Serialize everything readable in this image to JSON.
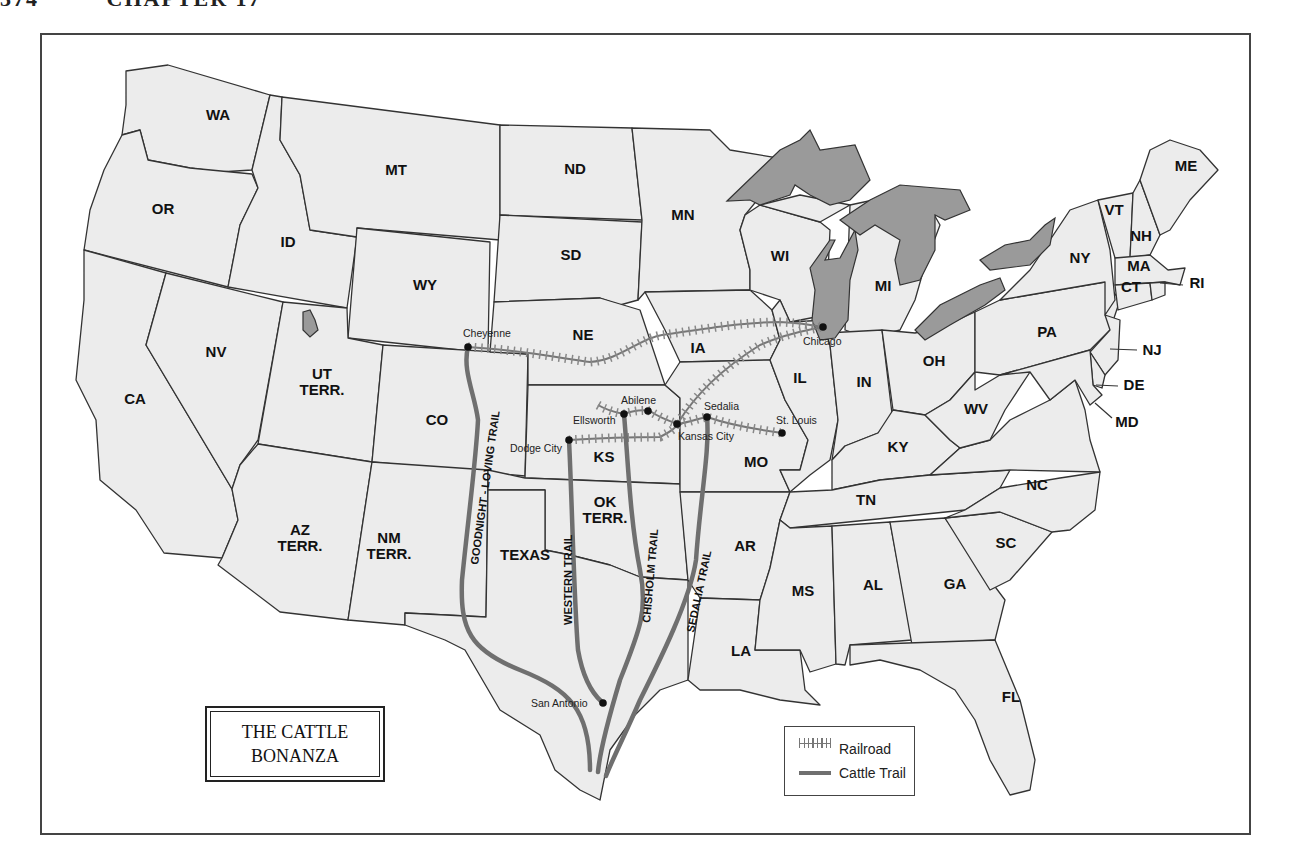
{
  "page_header": {
    "page_number": "374",
    "chapter": "CHAPTER 17"
  },
  "map": {
    "title_line1": "THE CATTLE",
    "title_line2": "BONANZA",
    "legend": {
      "railroad": "Railroad",
      "cattle_trail": "Cattle Trail"
    },
    "colors": {
      "land": "#ececec",
      "water": "#9a9a9a",
      "trail": "#6f6f6f",
      "railroad": "#777777",
      "border": "#333333"
    },
    "states": {
      "WA": "WA",
      "OR": "OR",
      "CA": "CA",
      "ID": "ID",
      "NV": "NV",
      "MT": "MT",
      "WY": "WY",
      "UT1": "UT",
      "UT2": "TERR.",
      "CO": "CO",
      "AZ1": "AZ",
      "AZ2": "TERR.",
      "NM1": "NM",
      "NM2": "TERR.",
      "ND": "ND",
      "SD": "SD",
      "NE": "NE",
      "KS": "KS",
      "OK1": "OK",
      "OK2": "TERR.",
      "TX": "TEXAS",
      "MN": "MN",
      "IA": "IA",
      "MO": "MO",
      "AR": "AR",
      "LA": "LA",
      "WI": "WI",
      "IL": "IL",
      "MI": "MI",
      "IN": "IN",
      "OH": "OH",
      "KY": "KY",
      "TN": "TN",
      "MS": "MS",
      "AL": "AL",
      "GA": "GA",
      "FL": "FL",
      "SC": "SC",
      "NC": "NC",
      "WV": "WV",
      "PA": "PA",
      "NY": "NY",
      "VT": "VT",
      "NH": "NH",
      "ME": "ME",
      "MA": "MA",
      "CT": "CT",
      "RI": "RI",
      "NJ": "NJ",
      "DE": "DE",
      "MD": "MD"
    },
    "cities": {
      "cheyenne": "Cheyenne",
      "chicago": "Chicago",
      "abilene": "Abilene",
      "ellsworth": "Ellsworth",
      "dodge_city": "Dodge City",
      "kansas_city": "Kansas City",
      "sedalia": "Sedalia",
      "st_louis": "St. Louis",
      "san_antonio": "San Antonio"
    },
    "trails": {
      "goodnight_loving": "GOODNIGHT - LOVING TRAIL",
      "western": "WESTERN TRAIL",
      "chisholm": "CHISHOLM TRAIL",
      "sedalia": "SEDALIA TRAIL"
    }
  }
}
